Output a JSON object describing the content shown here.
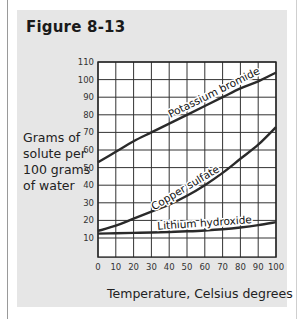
{
  "figure": {
    "title": "Figure 8-13",
    "ylabel_lines": [
      "Grams of",
      "solute per",
      "100 grams",
      "of water"
    ],
    "xlabel": "Temperature, Celsius degrees"
  },
  "colors": {
    "panel": "#e6e6e6",
    "plot_bg": "#ffffff",
    "grid": "#333333",
    "curve": "#2a2a2a"
  },
  "chart_data": {
    "type": "line",
    "title": "Figure 8-13",
    "xlabel": "Temperature, Celsius degrees",
    "ylabel": "Grams of solute per 100 grams of water",
    "xlim": [
      0,
      100
    ],
    "ylim": [
      0,
      110
    ],
    "x_ticks": [
      0,
      10,
      20,
      30,
      40,
      50,
      60,
      70,
      80,
      90,
      100
    ],
    "y_ticks": [
      10,
      20,
      30,
      40,
      50,
      60,
      70,
      80,
      90,
      100,
      110
    ],
    "grid": true,
    "legend": "inline labels on curves",
    "x": [
      0,
      10,
      20,
      30,
      40,
      50,
      60,
      70,
      80,
      90,
      100
    ],
    "series": [
      {
        "name": "Potassium bromide",
        "values": [
          53,
          59,
          65,
          70,
          75,
          80,
          85,
          90,
          95,
          99,
          104
        ]
      },
      {
        "name": "Copper sulfate",
        "values": [
          14,
          17,
          21,
          25,
          29,
          34,
          40,
          47,
          55,
          63,
          73
        ]
      },
      {
        "name": "Lithium hydroxide",
        "values": [
          12.5,
          12.7,
          12.9,
          13.1,
          13.4,
          13.8,
          14.3,
          15,
          16,
          17.3,
          19
        ]
      }
    ]
  }
}
